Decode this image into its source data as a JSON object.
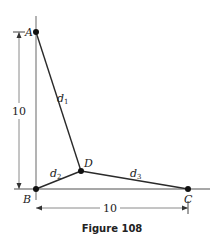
{
  "figure": {
    "caption": "Figure 108",
    "points": {
      "A": {
        "label": "A",
        "x": 36,
        "y": 32
      },
      "B": {
        "label": "B",
        "x": 36,
        "y": 189
      },
      "C": {
        "label": "C",
        "x": 188,
        "y": 189
      },
      "D": {
        "label": "D",
        "x": 81,
        "y": 171
      }
    },
    "segments": {
      "d1": {
        "label": "d",
        "sub": "1"
      },
      "d2": {
        "label": "d",
        "sub": "2"
      },
      "d3": {
        "label": "d",
        "sub": "3"
      }
    },
    "dimensions": {
      "vertical": "10",
      "horizontal": "10"
    },
    "colors": {
      "line": "#2a2a2a",
      "axis": "#888888"
    }
  }
}
